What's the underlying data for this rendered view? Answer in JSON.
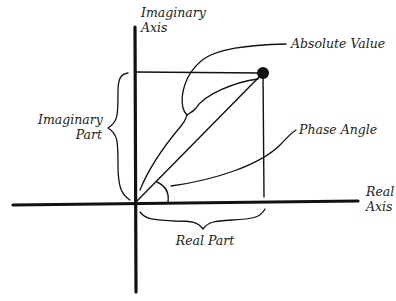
{
  "diagram": {
    "labels": {
      "imaginary_axis": [
        "Imaginary",
        "Axis"
      ],
      "real_axis": [
        "Real",
        "Axis"
      ],
      "absolute_value": "Absolute Value",
      "phase_angle": "Phase Angle",
      "imaginary_part": [
        "Imaginary",
        "Part"
      ],
      "real_part": "Real Part"
    },
    "colors": {
      "stroke": "#111111",
      "text": "#222222",
      "background": "#ffffff"
    },
    "geometry": {
      "origin": [
        135,
        203
      ],
      "point": [
        263,
        73
      ],
      "point_radius": 6
    }
  }
}
